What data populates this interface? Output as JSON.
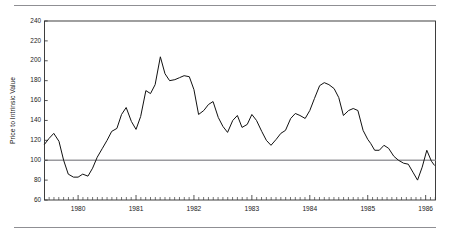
{
  "page": {
    "background": "#ffffff",
    "rule_color": "#8f8f93",
    "top_rule_label": "top-divider-rule",
    "bottom_rule_label": "bottom-divider-rule"
  },
  "chart_data": {
    "type": "line",
    "title": "",
    "subtitle": "",
    "xlabel": "",
    "ylabel": "Price to Intrinsic Value",
    "ylim": [
      60,
      240
    ],
    "xlim": [
      1979.42,
      1986.17
    ],
    "grid": false,
    "legend": null,
    "line_color": "#111111",
    "reference_line": {
      "value": 100,
      "color": "#9a9a9e",
      "label": "fair-value-100"
    },
    "ytick_labels": [
      "60",
      "80",
      "100",
      "120",
      "140",
      "160",
      "180",
      "200",
      "220",
      "240"
    ],
    "yticks": [
      60,
      80,
      100,
      120,
      140,
      160,
      180,
      200,
      220,
      240
    ],
    "xtick_labels": [
      "1980",
      "1981",
      "1982",
      "1983",
      "1984",
      "1985",
      "1986"
    ],
    "xticks": [
      1980,
      1981,
      1982,
      1983,
      1984,
      1985,
      1986
    ],
    "x_minor_tick_interval_months": 1,
    "series": [
      {
        "name": "Price to Intrinsic Value",
        "x": [
          1979.42,
          1979.5,
          1979.58,
          1979.67,
          1979.75,
          1979.83,
          1979.92,
          1980.0,
          1980.08,
          1980.17,
          1980.25,
          1980.33,
          1980.42,
          1980.5,
          1980.58,
          1980.67,
          1980.75,
          1980.83,
          1980.92,
          1981.0,
          1981.08,
          1981.17,
          1981.25,
          1981.33,
          1981.42,
          1981.5,
          1981.58,
          1981.67,
          1981.75,
          1981.83,
          1981.92,
          1982.0,
          1982.08,
          1982.17,
          1982.25,
          1982.33,
          1982.42,
          1982.5,
          1982.58,
          1982.67,
          1982.75,
          1982.83,
          1982.92,
          1983.0,
          1983.08,
          1983.17,
          1983.25,
          1983.33,
          1983.42,
          1983.5,
          1983.58,
          1983.67,
          1983.75,
          1983.83,
          1983.92,
          1984.0,
          1984.08,
          1984.17,
          1984.25,
          1984.33,
          1984.42,
          1984.5,
          1984.58,
          1984.67,
          1984.75,
          1984.83,
          1984.92,
          1985.0,
          1985.08,
          1985.17,
          1985.25,
          1985.33,
          1985.42,
          1985.5,
          1985.58,
          1985.67,
          1985.75,
          1985.83,
          1985.92,
          1986.0,
          1986.08,
          1986.17
        ],
        "values": [
          116,
          122,
          127,
          119,
          100,
          86,
          83,
          83,
          86,
          84,
          92,
          103,
          112,
          120,
          129,
          132,
          146,
          153,
          139,
          131,
          144,
          170,
          167,
          176,
          204,
          187,
          180,
          181,
          183,
          185,
          184,
          171,
          146,
          150,
          156,
          159,
          143,
          134,
          128,
          140,
          145,
          133,
          136,
          146,
          140,
          129,
          120,
          115,
          121,
          127,
          130,
          142,
          147,
          145,
          142,
          150,
          162,
          175,
          178,
          176,
          172,
          163,
          145,
          150,
          152,
          150,
          130,
          121,
          114,
          113,
          118,
          129,
          106,
          117,
          111,
          101,
          93,
          97,
          99,
          103,
          115,
          113
        ]
      }
    ],
    "series_continued": {
      "note": "tail segment",
      "x": [
        1985.92,
        1986.0,
        1986.08,
        1986.17
      ],
      "values": [
        99,
        103,
        115,
        113
      ]
    },
    "data_points_tail": [
      {
        "x": 1985.05,
        "y": 117
      },
      {
        "x": 1985.12,
        "y": 110
      },
      {
        "x": 1985.2,
        "y": 110
      },
      {
        "x": 1985.28,
        "y": 115
      },
      {
        "x": 1985.36,
        "y": 112
      },
      {
        "x": 1985.45,
        "y": 104
      },
      {
        "x": 1985.53,
        "y": 100
      },
      {
        "x": 1985.62,
        "y": 97
      },
      {
        "x": 1985.7,
        "y": 96
      },
      {
        "x": 1985.78,
        "y": 88
      },
      {
        "x": 1985.86,
        "y": 80
      },
      {
        "x": 1985.94,
        "y": 93
      },
      {
        "x": 1986.02,
        "y": 110
      },
      {
        "x": 1986.1,
        "y": 99
      },
      {
        "x": 1986.15,
        "y": 95
      }
    ]
  },
  "axes": {
    "y_axis_name": "y-axis",
    "x_axis_name": "x-axis",
    "plot_frame_name": "plot-frame"
  }
}
